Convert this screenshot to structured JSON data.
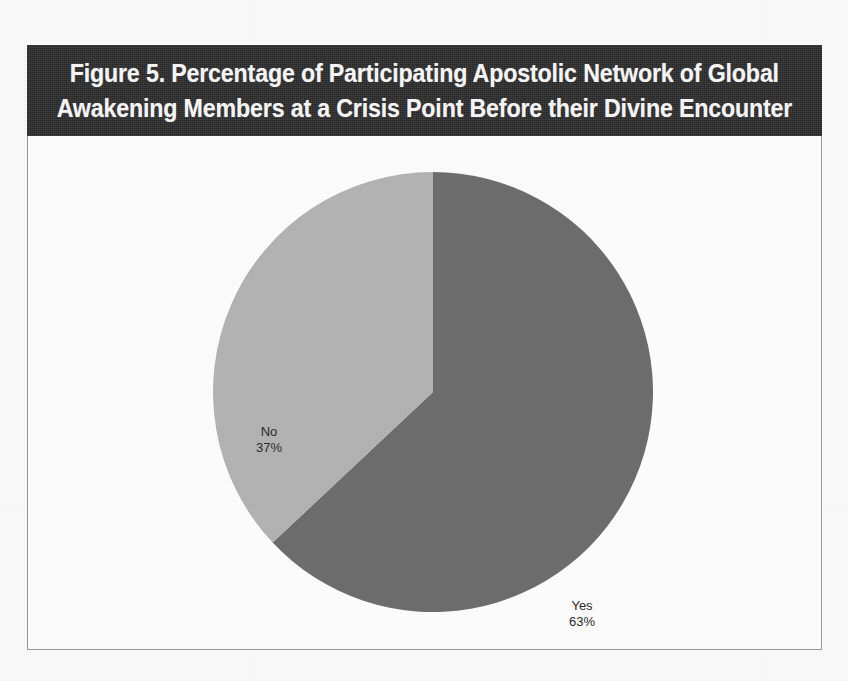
{
  "figure": {
    "title_line_1": "Figure 5. Percentage of Participating Apostolic Network of Global",
    "title_line_2": "Awakening Members at a Crisis Point Before their Divine Encounter",
    "title_full": "Figure 5. Percentage of Participating Apostolic Network of Global Awakening Members at a Crisis Point Before their Divine Encounter"
  },
  "colors": {
    "title_banner_background": "#2d2d2d",
    "title_text": "#f4f4f4",
    "slice_yes": "#6e6e6e",
    "slice_no": "#b4b4b4",
    "frame_border": "#9a9a9a",
    "label_text": "#2b2b2b",
    "plot_background": "#fefefe"
  },
  "labels": {
    "no": {
      "name": "No",
      "value": "37%"
    },
    "yes": {
      "name": "Yes",
      "value": "63%"
    }
  },
  "chart_data": {
    "type": "pie",
    "title": "Figure 5. Percentage of Participating Apostolic Network of Global Awakening Members at a Crisis Point Before their Divine Encounter",
    "xlabel": "",
    "ylabel": "",
    "categories": [
      "Yes",
      "No"
    ],
    "values": [
      63,
      37
    ],
    "value_unit": "percent",
    "data_labels": [
      "Yes\n63%",
      "No\n37%"
    ],
    "slices": [
      {
        "label": "Yes",
        "value": 63,
        "display": "63%",
        "color": "#6e6e6e",
        "start_angle_deg": 0,
        "end_angle_deg": 226.8,
        "direction": "clockwise-from-12-oclock"
      },
      {
        "label": "No",
        "value": 37,
        "display": "37%",
        "color": "#b4b4b4",
        "start_angle_deg": 226.8,
        "end_angle_deg": 360,
        "direction": "clockwise-from-12-oclock"
      }
    ],
    "legend": false,
    "legend_position": "none",
    "grid": false,
    "labels_inside_slices": true
  }
}
